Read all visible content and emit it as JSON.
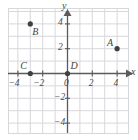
{
  "figure": {
    "background_color": "#ffffff",
    "grid_color": "#d8d8dc",
    "axis_color": "#5a5a5e",
    "point_color": "#3f3f44",
    "label_color": "#4a4a4a"
  },
  "chart_data": {
    "type": "scatter",
    "title": "",
    "xlabel": "x",
    "ylabel": "y",
    "xlim": [
      -4.7,
      4.9
    ],
    "ylim": [
      -5.2,
      5.2
    ],
    "grid": true,
    "grid_step": 1,
    "legend": "none",
    "x_ticks": [
      -4,
      -2,
      0,
      2,
      4
    ],
    "x_tick_labels": [
      "−4",
      "−2",
      "0",
      "2",
      "4"
    ],
    "y_ticks": [
      4,
      2,
      -2,
      -4
    ],
    "y_tick_labels": [
      "4",
      "2",
      "−2",
      "−4"
    ],
    "axis_arrows": [
      "x-positive",
      "y-positive"
    ],
    "points": [
      {
        "label": "A",
        "x": 4,
        "y": 2,
        "label_dx": -10,
        "label_dy": -11
      },
      {
        "label": "B",
        "x": -3,
        "y": 4,
        "label_dx": 2,
        "label_dy": 3
      },
      {
        "label": "C",
        "x": -3,
        "y": 0,
        "label_dx": -10,
        "label_dy": -13
      },
      {
        "label": "D",
        "x": 0,
        "y": 0,
        "label_dx": 3,
        "label_dy": -13
      }
    ]
  },
  "axis_labels": {
    "x": "x",
    "y": "y"
  },
  "ticks": {
    "x": [
      "−4",
      "−2",
      "0",
      "2",
      "4"
    ],
    "y_positive": [
      "4",
      "2"
    ],
    "y_negative": [
      "−2",
      "−4"
    ]
  },
  "points": {
    "a": {
      "name": "A",
      "coords": "(4, 2)"
    },
    "b": {
      "name": "B",
      "coords": "(−3, 4)"
    },
    "c": {
      "name": "C",
      "coords": "(−3, 0)"
    },
    "d": {
      "name": "D",
      "coords": "(0, 0)"
    }
  }
}
